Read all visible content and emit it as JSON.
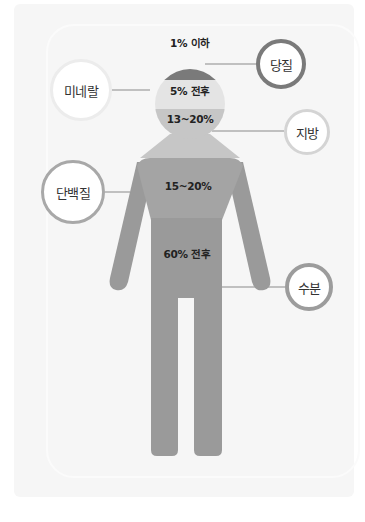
{
  "colors": {
    "sugar": "#7a7a7a",
    "mineral": "#e4e4e4",
    "fat": "#c6c6c6",
    "protein": "#a4a4a4",
    "water": "#9a9a9a",
    "label_text": "#222222",
    "background_panel": "#f6f6f6"
  },
  "components": [
    {
      "name": "당질",
      "percent": "1% 이하",
      "bubble_border": "#7a7a7a"
    },
    {
      "name": "미네랄",
      "percent": "5% 전후",
      "bubble_border": "#eeeeee"
    },
    {
      "name": "지방",
      "percent": "13~20%",
      "bubble_border": "#d4d4d4"
    },
    {
      "name": "단백질",
      "percent": "15~20%",
      "bubble_border": "#a8a8a8"
    },
    {
      "name": "수분",
      "percent": "60% 전후",
      "bubble_border": "#9c9c9c"
    }
  ]
}
